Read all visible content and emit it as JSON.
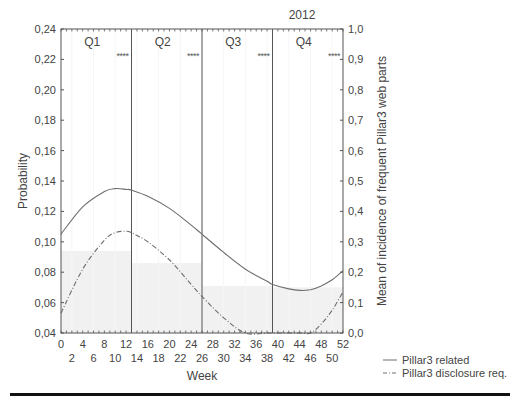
{
  "chart_data": {
    "type": "line",
    "title": "2012",
    "xlabel": "Week",
    "ylabel": "Probability",
    "y2label": "Mean of incidence of frequent Pillar3 web parts",
    "xlim": [
      0,
      52
    ],
    "ylim": [
      0.04,
      0.24
    ],
    "y2lim": [
      0.0,
      1.0
    ],
    "grid": false,
    "legend_position": "bottom-right outside",
    "x_ticks_top_row": [
      "0",
      "4",
      "8",
      "12",
      "16",
      "20",
      "24",
      "28",
      "32",
      "36",
      "40",
      "44",
      "48",
      "52"
    ],
    "x_ticks_bottom_row": [
      "2",
      "6",
      "10",
      "14",
      "18",
      "22",
      "26",
      "30",
      "34",
      "38",
      "42",
      "46",
      "50"
    ],
    "y_ticks": [
      "0,04",
      "0,06",
      "0,08",
      "0,10",
      "0,12",
      "0,14",
      "0,16",
      "0,18",
      "0,20",
      "0,22",
      "0,24"
    ],
    "y2_ticks": [
      "0,0",
      "0,1",
      "0,2",
      "0,3",
      "0,4",
      "0,5",
      "0,6",
      "0,7",
      "0,8",
      "0,9",
      "1,0"
    ],
    "quarters": [
      {
        "label": "Q1",
        "start_week": 0,
        "end_week": 13,
        "significance": "****",
        "bar_mean_incidence": 0.27
      },
      {
        "label": "Q2",
        "start_week": 13,
        "end_week": 26,
        "significance": "****",
        "bar_mean_incidence": 0.23
      },
      {
        "label": "Q3",
        "start_week": 26,
        "end_week": 39,
        "significance": "****",
        "bar_mean_incidence": 0.155
      },
      {
        "label": "Q4",
        "start_week": 39,
        "end_week": 52,
        "significance": "****",
        "bar_mean_incidence": 0.15
      }
    ],
    "x": [
      0,
      4,
      8,
      10,
      12,
      13,
      16,
      20,
      24,
      26,
      30,
      34,
      38,
      39,
      42,
      44,
      46,
      48,
      50,
      52
    ],
    "series": [
      {
        "name": "Pillar3 related",
        "style": "solid",
        "axis": "left",
        "values": [
          0.105,
          0.123,
          0.133,
          0.135,
          0.1345,
          0.134,
          0.13,
          0.122,
          0.111,
          0.105,
          0.093,
          0.082,
          0.074,
          0.072,
          0.069,
          0.068,
          0.0685,
          0.071,
          0.075,
          0.081
        ]
      },
      {
        "name": "Pillar3 disclosure req.",
        "style": "dash-dot",
        "axis": "left",
        "values": [
          0.053,
          0.082,
          0.101,
          0.106,
          0.107,
          0.106,
          0.1,
          0.088,
          0.072,
          0.064,
          0.05,
          0.04,
          0.04,
          0.04,
          0.04,
          0.04,
          0.04,
          0.046,
          0.055,
          0.067
        ]
      }
    ]
  },
  "legend": {
    "items": [
      {
        "label": "Pillar3 related",
        "style": "solid"
      },
      {
        "label": "Pillar3 disclosure req.",
        "style": "dash-dot"
      }
    ]
  },
  "colors": {
    "line": "#6e6e6e",
    "axis": "#555555",
    "bar_fill": "#f1f1f1",
    "divider": "#111111"
  }
}
